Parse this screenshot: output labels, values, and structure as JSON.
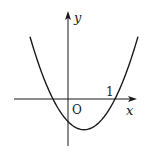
{
  "figure": {
    "x_axis_label": "x",
    "y_axis_label": "y",
    "origin_label": "O",
    "tick_label": "1"
  },
  "chart_data": {
    "type": "line",
    "title": "",
    "xlabel": "x",
    "ylabel": "y",
    "roots": [
      -0.32,
      1
    ],
    "vertex": [
      0.34,
      -0.66
    ],
    "y_intercept": -0.48,
    "leading_coefficient": 1.5,
    "x_ticks": [
      {
        "value": 1,
        "label": "1"
      }
    ],
    "xlim": [
      -1.15,
      1.45
    ],
    "ylim": [
      -1.0,
      1.85
    ],
    "grid": false,
    "legend": "none"
  },
  "colors": {
    "ink": "#1a1a1a",
    "background": "#ffffff"
  }
}
